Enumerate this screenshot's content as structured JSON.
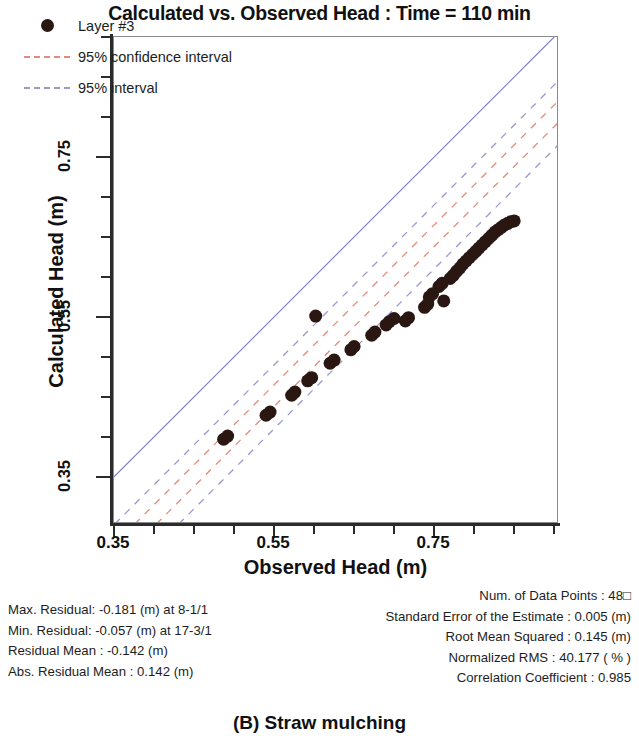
{
  "title": "Calculated vs. Observed Head : Time = 110 min",
  "caption": "(B) Straw mulching",
  "axes": {
    "x_title": "Observed Head (m)",
    "y_title": "Calculated Head (m)",
    "x_ticks": [
      "0.35",
      "0.55",
      "0.75"
    ],
    "y_ticks": [
      "0.35",
      "0.55",
      "0.75"
    ],
    "x_tick_values": [
      0.35,
      0.55,
      0.75
    ],
    "y_tick_values": [
      0.35,
      0.55,
      0.75
    ],
    "xlim": [
      0.35,
      0.906
    ],
    "ylim": [
      0.291,
      0.9
    ]
  },
  "legend": {
    "items": [
      {
        "label": "Layer #3",
        "key": "marker",
        "color": "#2a1712"
      },
      {
        "label": "95% confidence interval",
        "key": "dashed",
        "color": "#e08b7b"
      },
      {
        "label": "95% interval",
        "key": "dashed",
        "color": "#9a9ac8"
      }
    ]
  },
  "stats_left": [
    "Max. Residual: -0.181 (m) at 8-1/1",
    "Min. Residual: -0.057 (m) at 17-3/1",
    "Residual Mean : -0.142 (m)",
    "Abs. Residual Mean : 0.142 (m)"
  ],
  "stats_right": [
    "Num. of Data Points : 48□",
    "Standard Error of the Estimate : 0.005 (m)",
    "Root Mean Squared : 0.145 (m)",
    "Normalized RMS : 40.177 ( % )",
    "Correlation Coefficient : 0.985"
  ],
  "chart_data": {
    "type": "scatter",
    "title": "Calculated vs. Observed Head : Time = 110 min",
    "xlabel": "Observed Head (m)",
    "ylabel": "Calculated Head (m)",
    "xlim": [
      0.35,
      0.906
    ],
    "ylim": [
      0.291,
      0.9
    ],
    "grid": false,
    "legend_position": "top-left",
    "series": [
      {
        "name": "Layer #3",
        "type": "scatter",
        "marker": "circle",
        "color": "#2a1712",
        "marker_size": 13,
        "points": [
          [
            0.487,
            0.397
          ],
          [
            0.492,
            0.401
          ],
          [
            0.54,
            0.427
          ],
          [
            0.545,
            0.431
          ],
          [
            0.572,
            0.452
          ],
          [
            0.576,
            0.456
          ],
          [
            0.592,
            0.47
          ],
          [
            0.597,
            0.474
          ],
          [
            0.602,
            0.551
          ],
          [
            0.62,
            0.492
          ],
          [
            0.625,
            0.496
          ],
          [
            0.646,
            0.509
          ],
          [
            0.65,
            0.513
          ],
          [
            0.672,
            0.527
          ],
          [
            0.676,
            0.531
          ],
          [
            0.69,
            0.54
          ],
          [
            0.694,
            0.544
          ],
          [
            0.7,
            0.548
          ],
          [
            0.714,
            0.545
          ],
          [
            0.718,
            0.549
          ],
          [
            0.738,
            0.562
          ],
          [
            0.742,
            0.566
          ],
          [
            0.744,
            0.575
          ],
          [
            0.748,
            0.579
          ],
          [
            0.756,
            0.588
          ],
          [
            0.76,
            0.592
          ],
          [
            0.762,
            0.57
          ],
          [
            0.77,
            0.598
          ],
          [
            0.774,
            0.602
          ],
          [
            0.778,
            0.607
          ],
          [
            0.782,
            0.611
          ],
          [
            0.786,
            0.616
          ],
          [
            0.79,
            0.62
          ],
          [
            0.794,
            0.624
          ],
          [
            0.798,
            0.628
          ],
          [
            0.802,
            0.632
          ],
          [
            0.806,
            0.636
          ],
          [
            0.81,
            0.64
          ],
          [
            0.814,
            0.644
          ],
          [
            0.818,
            0.648
          ],
          [
            0.822,
            0.652
          ],
          [
            0.826,
            0.656
          ],
          [
            0.83,
            0.659
          ],
          [
            0.834,
            0.662
          ],
          [
            0.838,
            0.665
          ],
          [
            0.842,
            0.667
          ],
          [
            0.846,
            0.669
          ],
          [
            0.85,
            0.67
          ]
        ]
      }
    ],
    "reference_lines": [
      {
        "name": "1:1 line",
        "type": "solid",
        "color": "#7b7bc8",
        "slope": 1,
        "intercept": 0
      },
      {
        "name": "95% confidence interval upper",
        "type": "dashed",
        "color": "#e08b7b",
        "slope": 1,
        "intercept": -0.085
      },
      {
        "name": "95% confidence interval lower",
        "type": "dashed",
        "color": "#e08b7b",
        "slope": 1,
        "intercept": -0.112
      },
      {
        "name": "95% interval upper",
        "type": "dashed",
        "color": "#9a9ac8",
        "slope": 1,
        "intercept": -0.06
      },
      {
        "name": "95% interval lower",
        "type": "dashed",
        "color": "#9a9ac8",
        "slope": 1,
        "intercept": -0.14
      }
    ]
  }
}
